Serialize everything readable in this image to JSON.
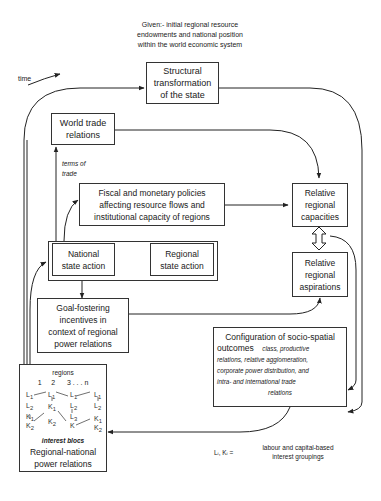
{
  "given_note": {
    "line1": "Given:- initial regional resource",
    "line2": "endowments and national position",
    "line3": "within the world economic system"
  },
  "time_label": "time",
  "boxes": {
    "structural": {
      "line1": "Structural",
      "line2": "transformation",
      "line3": "of the state"
    },
    "world_trade": {
      "line1": "World trade",
      "line2": "relations"
    },
    "terms_of_trade": {
      "line1": "terms of",
      "line2": "trade"
    },
    "fiscal": {
      "line1": "Fiscal and monetary policies",
      "line2": "affecting resource flows and",
      "line3": "institutional capacity of regions"
    },
    "capacities": {
      "line1": "Relative",
      "line2": "regional",
      "line3": "capacities"
    },
    "national": {
      "line1": "National",
      "line2": "state action"
    },
    "regional_state": {
      "line1": "Regional",
      "line2": "state action"
    },
    "aspirations": {
      "line1": "Relative",
      "line2": "regional",
      "line3": "aspirations"
    },
    "goal": {
      "line1": "Goal-fostering",
      "line2": "incentives in",
      "line3": "context of regional",
      "line4": "power relations"
    },
    "config": {
      "title": "Configuration of socio-spatial",
      "title2": "outcomes",
      "detail1": "class, productive",
      "detail2": "relations, relative agglomeration,",
      "detail3": "corporate power distribution, and",
      "detail4": "intra- and international trade",
      "detail5": "relations"
    },
    "regional_national": {
      "regions_label": "regions",
      "region_numbers": "1     2      3 . . . n",
      "interest_blocs": "interest blocs",
      "line1": "Regional-national",
      "line2": "power relations",
      "blocs": [
        "L1",
        "L2",
        "K1",
        "K2",
        "L1",
        "K1",
        "K2",
        "L1",
        "L2",
        "L3",
        "K",
        "L1",
        "L2",
        "K1",
        "K2"
      ]
    }
  },
  "legend": {
    "symbol": "Lᵢ, Kᵢ =",
    "line1": "labour and capital-based",
    "line2": "interest groupings"
  }
}
